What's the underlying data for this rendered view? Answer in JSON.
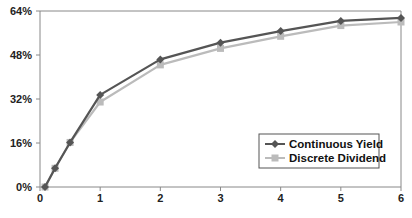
{
  "chart_data": {
    "type": "line",
    "title": "",
    "xlabel": "",
    "ylabel": "",
    "x": [
      0.083,
      0.25,
      0.5,
      1,
      2,
      3,
      4,
      5,
      6
    ],
    "xlim": [
      0,
      6
    ],
    "ylim": [
      0,
      64
    ],
    "x_ticks": [
      0,
      1,
      2,
      3,
      4,
      5,
      6
    ],
    "x_tick_labels": [
      "0",
      "1",
      "2",
      "3",
      "4",
      "5",
      "6"
    ],
    "y_ticks": [
      0,
      16,
      32,
      48,
      64
    ],
    "y_tick_labels": [
      "0%",
      "16%",
      "32%",
      "48%",
      "64%"
    ],
    "grid": "top-line-only",
    "legend_position": "bottom-right",
    "series": [
      {
        "name": "Continuous Yield",
        "color": "#555555",
        "marker": "diamond",
        "values": [
          0.0,
          6.8,
          16.2,
          33.5,
          46.4,
          52.5,
          56.7,
          60.4,
          61.5
        ]
      },
      {
        "name": "Discrete Dividend",
        "color": "#bbbbbb",
        "marker": "square",
        "values": [
          0.0,
          6.8,
          16.2,
          30.9,
          44.4,
          50.4,
          54.8,
          58.7,
          60.0
        ]
      }
    ]
  }
}
